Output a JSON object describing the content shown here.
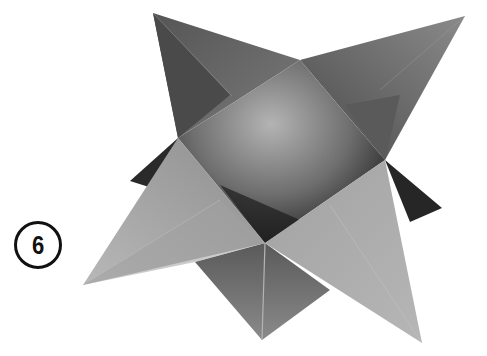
{
  "figure": {
    "step_number": "6",
    "colors": {
      "background": "#ffffff",
      "paper_light": "#a8a8a8",
      "paper_mid": "#7a7a7a",
      "paper_dark": "#3a3a3a",
      "badge_stroke": "#111111"
    }
  }
}
